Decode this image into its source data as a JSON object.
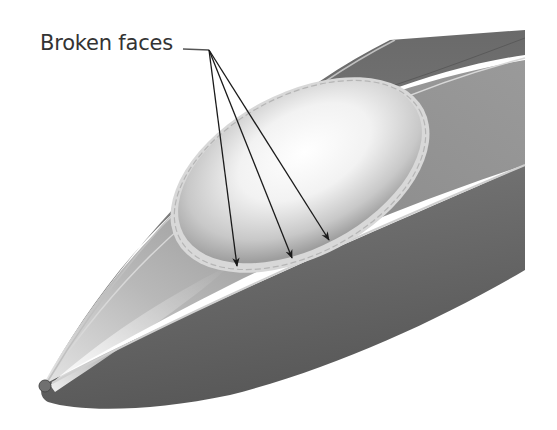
{
  "figure": {
    "callout": {
      "label": "Broken faces",
      "arrow_count": 3
    },
    "colors": {
      "background": "#ffffff",
      "label_text": "#333333",
      "arrow": "#1a1a1a",
      "hull_dark": "#5a5a5a",
      "hull_mid": "#8a8a8a",
      "hull_light": "#d8d8d8",
      "canopy_highlight": "#fafafa",
      "edge_line": "#c8c8c8"
    }
  }
}
